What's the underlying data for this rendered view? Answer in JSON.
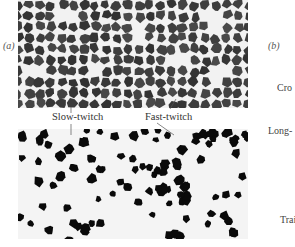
{
  "figure": {
    "panel_a_label": "(a)",
    "panel_b_label": "(b)",
    "annotations": {
      "slow_twitch": "Slow-twitch",
      "fast_twitch": "Fast-twitch"
    },
    "side_labels": [
      "Cro",
      "Long-",
      "Trai"
    ],
    "colors": {
      "background": "#ffffff",
      "top_section_bg": "#f2f2f2",
      "top_fiber": "#3c3c3c",
      "bottom_section_bg": "#f4f4f4",
      "bottom_fiber": "#0a0a0a",
      "leader_line": "#555555"
    },
    "top_micrograph": {
      "x": 18,
      "y": 0,
      "width": 230,
      "height": 108,
      "description": "cross-section of muscle fibers, all fibers dark-stained"
    },
    "bottom_micrograph": {
      "x": 18,
      "y": 129,
      "width": 230,
      "height": 110,
      "description": "cross-section stained for slow-twitch fibers (dark) among unstained fast-twitch fibers"
    }
  }
}
